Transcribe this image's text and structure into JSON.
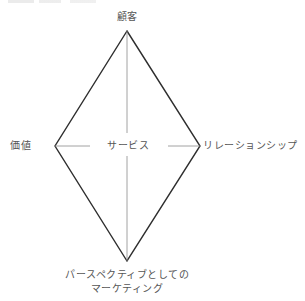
{
  "diagram": {
    "type": "diamond",
    "nodes": {
      "top": "顧客",
      "left": "価値",
      "right": "リレーションシップ",
      "center": "サービス",
      "bottom_line1": "パースペクティブとしての",
      "bottom_line2": "マーケティング"
    },
    "colors": {
      "outline": "#2e2e2e",
      "inner_lines": "#8a8a8a",
      "text": "#555555",
      "background": "#ffffff"
    }
  }
}
